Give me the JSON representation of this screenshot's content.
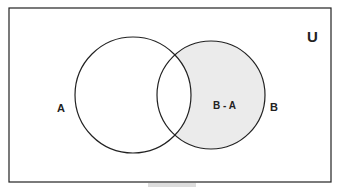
{
  "diagram": {
    "type": "venn",
    "universe_label": "U",
    "sets": [
      {
        "name": "A",
        "label": "A"
      },
      {
        "name": "B",
        "label": "B"
      }
    ],
    "shaded_region": {
      "label": "B - A",
      "fill": "#ebebeb"
    },
    "stroke_color": "#222222"
  }
}
